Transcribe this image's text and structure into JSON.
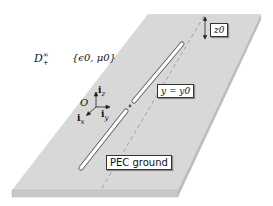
{
  "diagram": {
    "domain_label": "D",
    "domain_sup": "∞",
    "domain_sub": "+",
    "medium_params": "{ϵ0, μ0}",
    "origin_label": "O",
    "axes": {
      "x": "i",
      "x_sub": "x",
      "y": "i",
      "y_sub": "y",
      "z": "i",
      "z_sub": "z"
    },
    "height_label": "z0",
    "line_label": "y = y0",
    "ground_label": "PEC ground"
  },
  "colors": {
    "slab_top": "#d9d9d9",
    "slab_side": "#c4c4c4",
    "wire_fill": "#ffffff",
    "wire_stroke": "#555555",
    "dashed": "#8a8a8a"
  }
}
